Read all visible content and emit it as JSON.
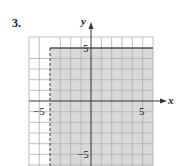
{
  "problem": {
    "number": "3."
  },
  "graph": {
    "x_axis_label": "x",
    "y_axis_label": "y",
    "tick_labels": {
      "x_neg": "−5",
      "x_pos": "5",
      "y_pos": "5",
      "y_neg": "−5"
    },
    "grid": {
      "xmin": -6,
      "xmax": 6,
      "ymin": -6,
      "ymax": 6,
      "step": 1
    },
    "boundaries": [
      {
        "type": "vertical",
        "value": -4,
        "style": "dashed"
      },
      {
        "type": "horizontal",
        "value": 5,
        "style": "solid"
      }
    ],
    "shaded_region": "x > -4 and y <= 5",
    "colors": {
      "shade": "#d9d9d9",
      "grid": "#b0b0b0",
      "axis": "#333333",
      "boundary": "#555555"
    }
  }
}
